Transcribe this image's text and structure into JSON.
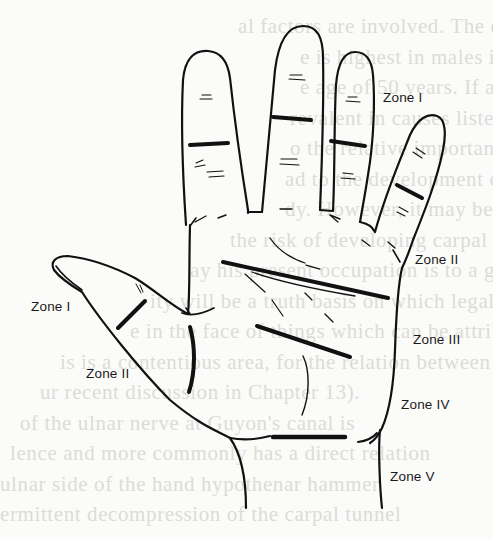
{
  "page": {
    "background_color": "#fbfbf9",
    "ink_color": "#111111",
    "bleed_text_color": "#dcdcd8"
  },
  "background_text": {
    "lines": [
      "al factors are involved. The overall inc",
      "e is highest in males in relation to fem",
      "e age of 50 years. If a patient is un",
      "revalent in causes listed above it will be",
      "o the relative importance of these factors",
      "ad to the development of the nerve compres",
      "dy. However, it may be right to give",
      "the risk of developing carpal tunnel syndrom",
      "ay his present occupation is to a greater or les",
      "ity will be a truth basis on which legal",
      "e in the face of things which can be attributed",
      "is is a contentious area, for the relation between",
      "ur recent discussion in Chapter 13).",
      "of the ulnar nerve at Guyon's canal is",
      "lence and more commonly has a direct relation",
      "ulnar side of the hand hypothenar hammer",
      "ermittent decompression of the carpal tunnel"
    ]
  },
  "diagram": {
    "zone_labels": [
      {
        "id": "zone-i-fingers",
        "text": "Zone I",
        "x": 383,
        "y": 90
      },
      {
        "id": "zone-ii-fingers",
        "text": "Zone II",
        "x": 415,
        "y": 252
      },
      {
        "id": "zone-i-thumb",
        "text": "Zone I",
        "x": 31,
        "y": 299
      },
      {
        "id": "zone-ii-thumb",
        "text": "Zone II",
        "x": 86,
        "y": 366
      },
      {
        "id": "zone-iii",
        "text": "Zone III",
        "x": 413,
        "y": 332
      },
      {
        "id": "zone-iv",
        "text": "Zone IV",
        "x": 401,
        "y": 397
      },
      {
        "id": "zone-v",
        "text": "Zone V",
        "x": 390,
        "y": 469
      }
    ]
  }
}
